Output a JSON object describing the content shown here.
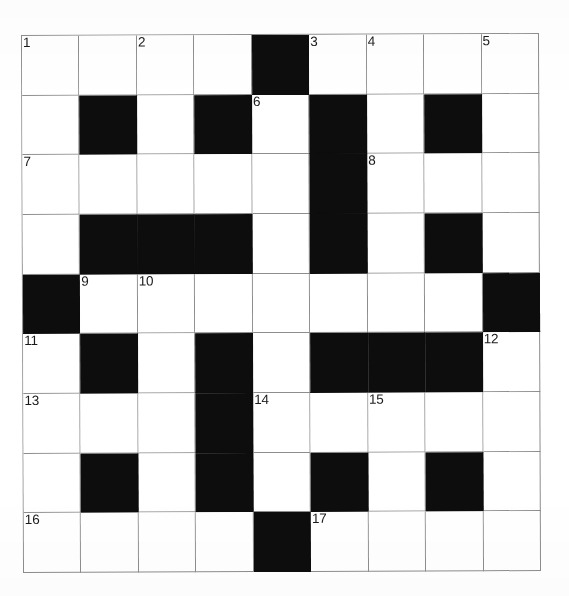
{
  "document": {
    "type": "crossword-grid",
    "title": "",
    "rows": 9,
    "columns": 9
  },
  "colors": {
    "paper": "#ffffff",
    "grid_line": "#8d8d8d",
    "block": "#0d0d0d",
    "number_text": "#1a1a1a"
  },
  "grid": {
    "rows": 9,
    "columns": 9,
    "black_squares": [
      [
        1,
        5
      ],
      [
        2,
        2
      ],
      [
        2,
        4
      ],
      [
        2,
        6
      ],
      [
        2,
        8
      ],
      [
        3,
        6
      ],
      [
        4,
        2
      ],
      [
        4,
        3
      ],
      [
        4,
        4
      ],
      [
        4,
        6
      ],
      [
        4,
        8
      ],
      [
        5,
        1
      ],
      [
        5,
        9
      ],
      [
        6,
        2
      ],
      [
        6,
        4
      ],
      [
        6,
        6
      ],
      [
        6,
        7
      ],
      [
        6,
        8
      ],
      [
        7,
        4
      ],
      [
        8,
        2
      ],
      [
        8,
        4
      ],
      [
        8,
        6
      ],
      [
        8,
        8
      ],
      [
        9,
        5
      ]
    ],
    "cell_matrix": [
      [
        "white",
        "white",
        "white",
        "white",
        "black",
        "white",
        "white",
        "white",
        "white"
      ],
      [
        "white",
        "black",
        "white",
        "black",
        "white",
        "black",
        "white",
        "black",
        "white"
      ],
      [
        "white",
        "white",
        "white",
        "white",
        "white",
        "black",
        "white",
        "white",
        "white"
      ],
      [
        "white",
        "black",
        "black",
        "black",
        "white",
        "black",
        "white",
        "black",
        "white"
      ],
      [
        "black",
        "white",
        "white",
        "white",
        "white",
        "white",
        "white",
        "white",
        "black"
      ],
      [
        "white",
        "black",
        "white",
        "black",
        "white",
        "black",
        "black",
        "black",
        "white"
      ],
      [
        "white",
        "white",
        "white",
        "black",
        "white",
        "white",
        "white",
        "white",
        "white"
      ],
      [
        "white",
        "black",
        "white",
        "black",
        "white",
        "black",
        "white",
        "black",
        "white"
      ],
      [
        "white",
        "white",
        "white",
        "white",
        "black",
        "white",
        "white",
        "white",
        "white"
      ]
    ],
    "numbers": [
      {
        "label": "1",
        "row": 1,
        "col": 1
      },
      {
        "label": "2",
        "row": 1,
        "col": 3
      },
      {
        "label": "3",
        "row": 1,
        "col": 6
      },
      {
        "label": "4",
        "row": 1,
        "col": 7
      },
      {
        "label": "5",
        "row": 1,
        "col": 9
      },
      {
        "label": "6",
        "row": 2,
        "col": 5
      },
      {
        "label": "7",
        "row": 3,
        "col": 1
      },
      {
        "label": "8",
        "row": 3,
        "col": 7
      },
      {
        "label": "9",
        "row": 5,
        "col": 2
      },
      {
        "label": "10",
        "row": 5,
        "col": 3
      },
      {
        "label": "11",
        "row": 6,
        "col": 1
      },
      {
        "label": "12",
        "row": 6,
        "col": 9
      },
      {
        "label": "13",
        "row": 7,
        "col": 1
      },
      {
        "label": "14",
        "row": 7,
        "col": 5
      },
      {
        "label": "15",
        "row": 7,
        "col": 7
      },
      {
        "label": "16",
        "row": 9,
        "col": 1
      },
      {
        "label": "17",
        "row": 9,
        "col": 6
      }
    ]
  }
}
